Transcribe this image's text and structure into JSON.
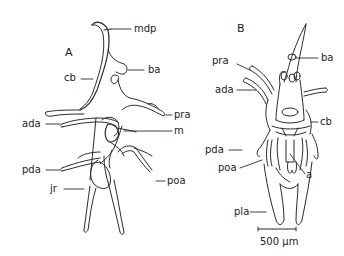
{
  "figure": {
    "panels": [
      {
        "id": "A",
        "label": "A",
        "annotations": [
          {
            "key": "mdp",
            "text": "mdp"
          },
          {
            "key": "cb",
            "text": "cb"
          },
          {
            "key": "ba",
            "text": "ba"
          },
          {
            "key": "pra",
            "text": "pra"
          },
          {
            "key": "ada",
            "text": "ada"
          },
          {
            "key": "m",
            "text": "m"
          },
          {
            "key": "pda",
            "text": "pda"
          },
          {
            "key": "jr",
            "text": "jr"
          },
          {
            "key": "poa",
            "text": "poa"
          }
        ]
      },
      {
        "id": "B",
        "label": "B",
        "annotations": [
          {
            "key": "ba",
            "text": "ba"
          },
          {
            "key": "pra",
            "text": "pra"
          },
          {
            "key": "ada",
            "text": "ada"
          },
          {
            "key": "cb",
            "text": "cb"
          },
          {
            "key": "pda",
            "text": "pda"
          },
          {
            "key": "poa",
            "text": "poa"
          },
          {
            "key": "a",
            "text": "a"
          },
          {
            "key": "pla",
            "text": "pla"
          }
        ],
        "scale_bar": {
          "text": "500 µm"
        }
      }
    ]
  }
}
